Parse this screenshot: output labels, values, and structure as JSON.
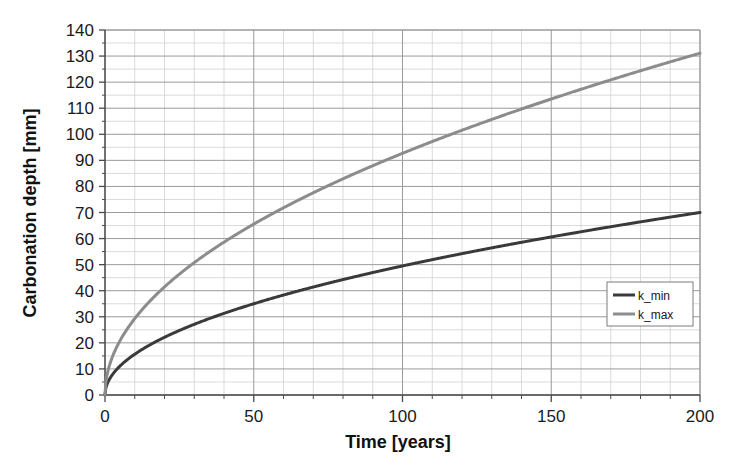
{
  "chart_data": {
    "type": "line",
    "title": "",
    "xlabel": "Time [years]",
    "ylabel": "Carbonation depth [mm]",
    "xlim": [
      0,
      200
    ],
    "ylim": [
      0,
      140
    ],
    "x_ticks_major": [
      0,
      50,
      100,
      150,
      200
    ],
    "x_tick_labels": [
      "0",
      "50",
      "100",
      "150",
      "200"
    ],
    "x_minor_step": 10,
    "y_ticks_major": [
      0,
      10,
      20,
      30,
      40,
      50,
      60,
      70,
      80,
      90,
      100,
      110,
      120,
      130,
      140
    ],
    "y_tick_labels": [
      "0",
      "10",
      "20",
      "30",
      "40",
      "50",
      "60",
      "70",
      "80",
      "90",
      "100",
      "110",
      "120",
      "130",
      "140"
    ],
    "y_minor_step": 5,
    "grid": true,
    "legend_position": "inside-right",
    "model": "depth = k * sqrt(time)",
    "series": [
      {
        "name": "k_min",
        "color": "#3a3a3a",
        "k": 4.95,
        "x": [
          0,
          1,
          2,
          5,
          10,
          15,
          20,
          25,
          30,
          40,
          50,
          60,
          70,
          80,
          90,
          100,
          110,
          120,
          130,
          140,
          150,
          160,
          170,
          180,
          190,
          200
        ],
        "values": [
          0.0,
          4.95,
          7.0,
          11.1,
          15.7,
          19.2,
          22.1,
          24.8,
          27.1,
          31.3,
          35.0,
          38.3,
          41.4,
          44.3,
          47.0,
          49.5,
          51.9,
          54.2,
          56.4,
          58.6,
          60.6,
          62.6,
          64.5,
          66.4,
          68.2,
          70.0
        ]
      },
      {
        "name": "k_max",
        "color": "#8c8c8c",
        "k": 9.27,
        "x": [
          0,
          1,
          2,
          5,
          10,
          15,
          20,
          25,
          30,
          40,
          50,
          60,
          70,
          80,
          90,
          100,
          110,
          120,
          130,
          140,
          150,
          160,
          170,
          180,
          190,
          200
        ],
        "values": [
          0.0,
          9.27,
          13.1,
          20.7,
          29.3,
          35.9,
          41.5,
          46.4,
          50.8,
          58.6,
          65.5,
          71.8,
          77.6,
          82.9,
          87.9,
          92.7,
          97.2,
          101.5,
          105.7,
          109.7,
          113.5,
          117.3,
          120.9,
          124.3,
          127.8,
          131.1
        ]
      }
    ],
    "legend_entries": [
      {
        "label": "k_min",
        "color": "#3a3a3a"
      },
      {
        "label": "k_max",
        "color": "#8c8c8c"
      }
    ],
    "colors": {
      "k_min": "#3a3a3a",
      "k_max": "#8c8c8c",
      "grid_major": "#9a9a9a",
      "grid_minor": "#d2d2d2",
      "axis": "#4a4a4a",
      "background": "#ffffff",
      "text": "#1a1a1a"
    }
  }
}
